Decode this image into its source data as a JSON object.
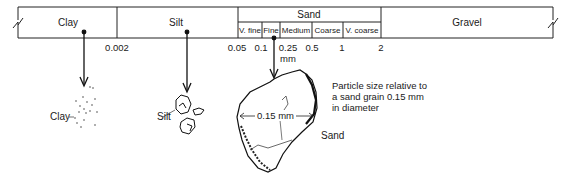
{
  "scale": {
    "classes": [
      {
        "name": "Clay",
        "x_center": 68
      },
      {
        "name": "Silt",
        "x_center": 176
      },
      {
        "name": "Sand",
        "x_center": 309
      },
      {
        "name": "Gravel",
        "x_center": 467
      }
    ],
    "sand_subclasses": [
      {
        "name": "V. fine",
        "x": 238,
        "w": 24
      },
      {
        "name": "Fine",
        "x": 262,
        "w": 18
      },
      {
        "name": "Medium",
        "x": 280,
        "w": 32
      },
      {
        "name": "Coarse",
        "x": 312,
        "w": 31
      },
      {
        "name": "V. coarse",
        "x": 343,
        "w": 38
      }
    ],
    "boundaries_mm": [
      {
        "label": "0.002",
        "x": 117
      },
      {
        "label": "0.05",
        "x": 237
      },
      {
        "label": "0.1",
        "x": 261
      },
      {
        "label": "0.25",
        "x": 288
      },
      {
        "label": "0.5",
        "x": 312
      },
      {
        "label": "1",
        "x": 342
      },
      {
        "label": "2",
        "x": 381
      }
    ],
    "unit": "mm"
  },
  "particles": {
    "clay_label": "Clay",
    "silt_label": "Silt",
    "sand_label": "Sand",
    "sand_measure": "0.15 mm"
  },
  "note": {
    "line1": "Particle size relative to",
    "line2": "a sand grain 0.15 mm",
    "line3": "in diameter"
  }
}
